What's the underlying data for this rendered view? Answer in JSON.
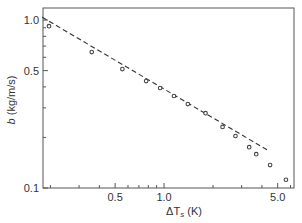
{
  "chart_data": {
    "type": "scatter",
    "title": "",
    "xlabel": "ΔT_s (K)",
    "xlabel_main": "ΔT",
    "xlabel_sub": "s",
    "xlabel_unit": " (K)",
    "ylabel": "b (kg/m/s)",
    "ylabel_var": "b",
    "ylabel_unit": " (kg/m/s)",
    "xscale": "log",
    "yscale": "log",
    "xlim": [
      0.18,
      6.3
    ],
    "ylim": [
      0.1,
      1.18
    ],
    "xticks_major": [
      0.5,
      1.0,
      5.0
    ],
    "xtick_labels": [
      "0.5",
      "1.0",
      "5.0"
    ],
    "xticks_minor": [
      0.2,
      0.3,
      0.4,
      0.6,
      0.7,
      0.8,
      0.9,
      2,
      3,
      4,
      6
    ],
    "yticks_major": [
      0.1,
      0.5,
      1.0
    ],
    "ytick_labels": [
      "0.1",
      "0.5",
      "1.0"
    ],
    "yticks_minor": [
      0.2,
      0.3,
      0.4,
      0.6,
      0.7,
      0.8,
      0.9
    ],
    "grid": false,
    "legend": null,
    "series": [
      {
        "name": "measured",
        "style": "open-circle markers",
        "x": [
          0.196,
          0.359,
          0.554,
          0.776,
          0.946,
          1.15,
          1.4,
          1.8,
          2.29,
          2.75,
          3.34,
          3.69,
          4.49,
          5.62
        ],
        "y": [
          0.92,
          0.645,
          0.511,
          0.433,
          0.394,
          0.353,
          0.316,
          0.279,
          0.231,
          0.204,
          0.175,
          0.159,
          0.137,
          0.112
        ]
      },
      {
        "name": "power-law fit",
        "style": "dashed line",
        "x": [
          0.178,
          4.43
        ],
        "y": [
          1.04,
          0.166
        ]
      }
    ]
  },
  "colors": {
    "axis": "#555555",
    "marker": "#444444",
    "line": "#333333",
    "background": "#ffffff"
  }
}
